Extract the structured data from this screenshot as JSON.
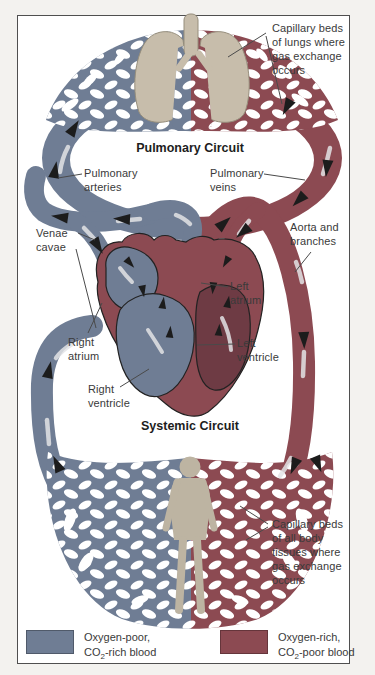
{
  "figure": "Human circulatory system: pulmonary and systemic circuits",
  "colors": {
    "oxygen_poor_blue": "#6f7d94",
    "oxygen_rich_red": "#8c4a52",
    "left_ventricle_dark_red": "#6e3b44",
    "lung_tan": "#c7bdab",
    "body_tan": "#bdb4a2",
    "background": "#ffffff",
    "frame": "#4f4f4f",
    "text": "#3a3a3a"
  },
  "labels": {
    "capillary_lungs": "Capillary beds\nof lungs where\ngas exchange\noccurs",
    "pulmonary_circuit": "Pulmonary Circuit",
    "pulmonary_arteries": "Pulmonary\narteries",
    "pulmonary_veins": "Pulmonary\nveins",
    "venae_cavae": "Venae\ncavae",
    "aorta_branches": "Aorta and\nbranches",
    "left_atrium": "Left\natrium",
    "right_atrium": "Right\natrium",
    "left_ventricle": "Left\nventricle",
    "right_ventricle": "Right\nventricle",
    "systemic_circuit": "Systemic Circuit",
    "capillary_body": "Capillary beds\nof all body\ntissues where\ngas exchange\noccurs"
  },
  "legend": {
    "items": [
      {
        "name": "oxygen-poor",
        "color": "#6f7d94",
        "line1": "Oxygen-poor,",
        "formula_prefix": "CO",
        "formula_sub": "2",
        "formula_suffix": "-rich blood"
      },
      {
        "name": "oxygen-rich",
        "color": "#8c4a52",
        "line1": "Oxygen-rich,",
        "formula_prefix": "CO",
        "formula_sub": "2",
        "formula_suffix": "-poor blood"
      }
    ]
  }
}
